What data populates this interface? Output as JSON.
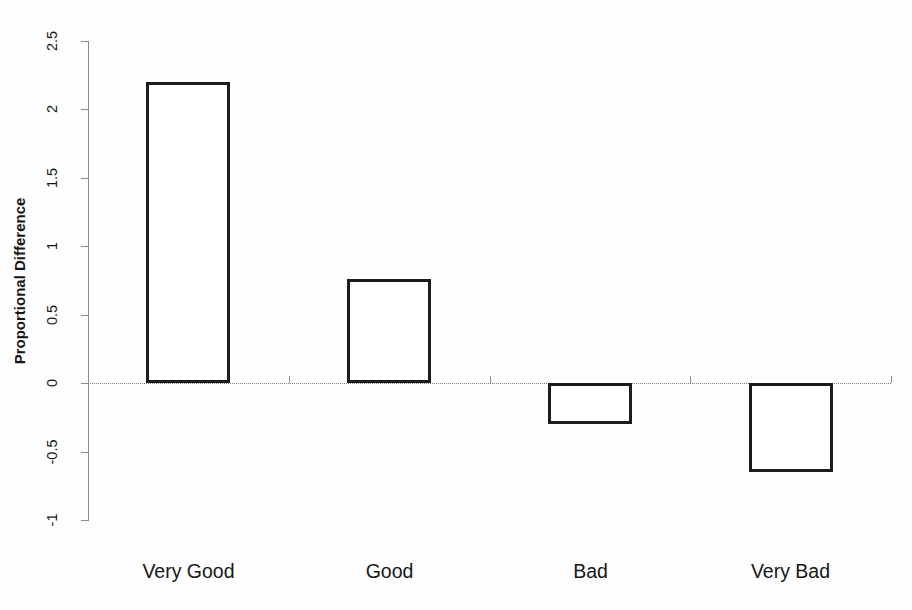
{
  "chart_data": {
    "type": "bar",
    "title": "",
    "subtitle": "",
    "xlabel": "",
    "ylabel": "Proportional Difference",
    "categories": [
      "Very Good",
      "Good",
      "Bad",
      "Very Bad"
    ],
    "values": [
      2.2,
      0.76,
      -0.3,
      -0.65
    ],
    "series": [
      {
        "name": "Proportional Difference",
        "values": [
          2.2,
          0.76,
          -0.3,
          -0.65
        ]
      }
    ],
    "ylim": [
      -1,
      2.5
    ],
    "ytick_labels": [
      "2.5",
      "2",
      "1.5",
      "1",
      "0.5",
      "0",
      "-0.5",
      "-1"
    ],
    "ytick_values": [
      2.5,
      2,
      1.5,
      1,
      0.5,
      0,
      -0.5,
      -1
    ],
    "ytick_step": 0.5,
    "grid": false,
    "legend": false,
    "legend_position": "none",
    "zero_reference_line": true,
    "zero_reference_style": "dotted",
    "bar_fill": "#ffffff",
    "bar_edge_color": "#1c1c1c",
    "axis_color": "#8a8a8a",
    "background": "#ffffff",
    "annotations": []
  },
  "axis": {
    "y_title": "Proportional Difference"
  }
}
